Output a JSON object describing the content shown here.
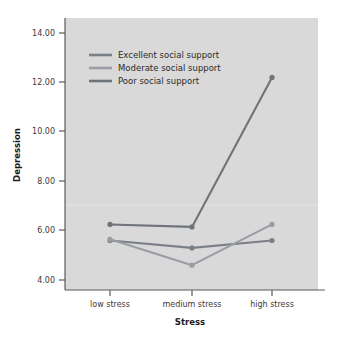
{
  "chart_data": {
    "type": "line",
    "title": "",
    "subtitle": "",
    "xlabel": "Stress",
    "ylabel": "Depression",
    "categories": [
      "low stress",
      "medium stress",
      "high stress"
    ],
    "xtick_labels": [
      "low stress",
      "medium stress",
      "high stress"
    ],
    "ytick_labels": [
      "4.00",
      "6.00",
      "8.00",
      "10.00",
      "12.00",
      "14.00"
    ],
    "ytick_values": [
      4,
      6,
      8,
      10,
      12,
      14
    ],
    "ylim": [
      3.2,
      14.9
    ],
    "grid": false,
    "legend_position": "upper-left-inside",
    "plot_background": "#d9d9d9",
    "figure_background": "#ffffff",
    "series": [
      {
        "name": "Excellent social support",
        "color": "#7b7f86",
        "values": [
          5.6,
          5.3,
          5.6
        ],
        "marker": "circle"
      },
      {
        "name": "Moderate social support",
        "color": "#9a9ea4",
        "values": [
          5.65,
          4.6,
          6.25
        ],
        "marker": "circle"
      },
      {
        "name": "Poor social support",
        "color": "#6f737a",
        "values": [
          6.25,
          6.15,
          12.2
        ],
        "marker": "circle"
      }
    ]
  },
  "axes": {
    "y_title": "Depression",
    "x_title": "Stress"
  },
  "legend": {
    "entries": [
      {
        "label": "Excellent social support"
      },
      {
        "label": "Moderate social support"
      },
      {
        "label": "Poor social support"
      }
    ]
  }
}
